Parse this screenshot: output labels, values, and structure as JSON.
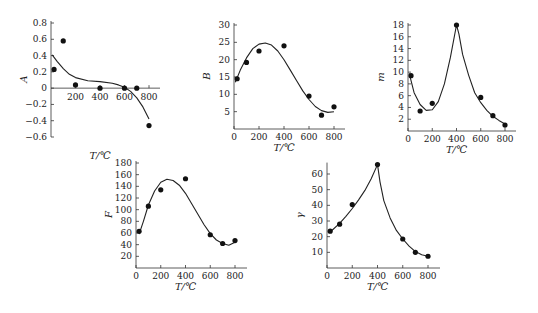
{
  "chart_data": [
    {
      "id": "A",
      "type": "scatter",
      "title": "",
      "xlabel": "T/℃",
      "ylabel": "A",
      "xlim": [
        0,
        900
      ],
      "ylim": [
        -0.6,
        0.8
      ],
      "xticks": [
        200,
        400,
        600,
        800
      ],
      "yticks": [
        -0.6,
        -0.4,
        -0.2,
        0,
        0.2,
        0.4,
        0.6,
        0.8
      ],
      "grid": false,
      "points": {
        "x": [
          25,
          100,
          200,
          400,
          600,
          700,
          800
        ],
        "y": [
          0.23,
          0.58,
          0.04,
          0.0,
          0.0,
          0.0,
          -0.46
        ]
      },
      "fit_curve": {
        "x": [
          10,
          50,
          100,
          150,
          200,
          300,
          400,
          500,
          550,
          600,
          650,
          700,
          750,
          800
        ],
        "y": [
          0.41,
          0.33,
          0.24,
          0.17,
          0.13,
          0.09,
          0.08,
          0.06,
          0.04,
          0.01,
          -0.04,
          -0.12,
          -0.23,
          -0.38
        ]
      }
    },
    {
      "id": "B",
      "type": "scatter",
      "title": "",
      "xlabel": "T/℃",
      "ylabel": "B",
      "xlim": [
        0,
        900
      ],
      "ylim": [
        0,
        30
      ],
      "xticks": [
        0,
        200,
        400,
        600,
        800
      ],
      "yticks": [
        5,
        10,
        15,
        20,
        25,
        30
      ],
      "grid": false,
      "points": {
        "x": [
          25,
          100,
          200,
          400,
          600,
          700,
          800
        ],
        "y": [
          14.5,
          19.2,
          22.5,
          24,
          9.5,
          4,
          6.4
        ]
      },
      "fit_curve": {
        "x": [
          10,
          50,
          100,
          150,
          200,
          250,
          300,
          350,
          400,
          450,
          500,
          550,
          600,
          650,
          700,
          750,
          800
        ],
        "y": [
          13.5,
          17,
          20.5,
          23.2,
          24.5,
          24.8,
          24.2,
          22.5,
          20,
          17,
          14,
          11,
          8.5,
          6.5,
          5.3,
          4.8,
          5
        ]
      }
    },
    {
      "id": "m",
      "type": "scatter",
      "title": "",
      "xlabel": "T/℃",
      "ylabel": "m",
      "xlim": [
        0,
        900
      ],
      "ylim": [
        0,
        18
      ],
      "xticks": [
        0,
        200,
        400,
        600,
        800
      ],
      "yticks": [
        2,
        4,
        6,
        8,
        10,
        12,
        14,
        16,
        18
      ],
      "grid": false,
      "points": {
        "x": [
          25,
          100,
          200,
          400,
          600,
          700,
          800
        ],
        "y": [
          9.4,
          3.4,
          4.7,
          18,
          5.7,
          2.6,
          1.0
        ]
      },
      "fit_curve": {
        "x": [
          10,
          50,
          100,
          150,
          200,
          250,
          300,
          350,
          400,
          420,
          450,
          500,
          550,
          600,
          650,
          700,
          750,
          800
        ],
        "y": [
          9.8,
          6.5,
          4.5,
          3.5,
          3.6,
          5,
          8,
          12.5,
          18,
          16.5,
          13,
          9.5,
          6.5,
          4.8,
          3.5,
          2.5,
          1.8,
          1.2
        ]
      }
    },
    {
      "id": "F",
      "type": "scatter",
      "title": "",
      "xlabel": "T/℃",
      "ylabel": "F",
      "xlim": [
        0,
        900
      ],
      "ylim": [
        0,
        180
      ],
      "xticks": [
        0,
        200,
        400,
        600,
        800
      ],
      "yticks": [
        20,
        40,
        60,
        80,
        100,
        120,
        140,
        160,
        180
      ],
      "grid": false,
      "points": {
        "x": [
          25,
          100,
          200,
          400,
          600,
          700,
          800
        ],
        "y": [
          63,
          106,
          134,
          153,
          57,
          42,
          47
        ]
      },
      "fit_curve": {
        "x": [
          25,
          60,
          100,
          150,
          200,
          250,
          300,
          350,
          400,
          450,
          500,
          550,
          600,
          650,
          700,
          750,
          800
        ],
        "y": [
          58,
          80,
          108,
          132,
          147,
          152,
          150,
          142,
          128,
          110,
          92,
          74,
          59,
          48,
          42,
          39,
          44
        ]
      }
    },
    {
      "id": "gamma",
      "type": "scatter",
      "title": "",
      "xlabel": "T/℃",
      "ylabel": "γ",
      "xlim": [
        0,
        900
      ],
      "ylim": [
        0,
        66
      ],
      "xticks": [
        0,
        200,
        400,
        600,
        800
      ],
      "yticks": [
        10,
        20,
        30,
        40,
        50,
        60
      ],
      "grid": false,
      "points": {
        "x": [
          25,
          100,
          200,
          400,
          600,
          700,
          800
        ],
        "y": [
          23.5,
          28,
          40.5,
          66,
          18.5,
          10,
          7.5
        ]
      },
      "fit_curve": {
        "x": [
          25,
          100,
          150,
          200,
          250,
          300,
          350,
          400,
          420,
          450,
          500,
          550,
          600,
          650,
          700,
          750,
          800
        ],
        "y": [
          23,
          28.5,
          33,
          38,
          43.5,
          49.5,
          57,
          66,
          55,
          43,
          32,
          24,
          18.5,
          14,
          10.5,
          8.5,
          7.5
        ]
      }
    }
  ],
  "layout": [
    {
      "x0": 51,
      "x800": 149,
      "ylo": -0.6,
      "yhi": 0.8,
      "pylo": 137,
      "pyhi": 23,
      "xaxisAtZero": true,
      "xend": 160
    },
    {
      "x0": 234,
      "x800": 334,
      "ylo": 0,
      "yhi": 30,
      "pylo": 129,
      "pyhi": 25,
      "xaxisAtZero": false,
      "xend": 345
    },
    {
      "x0": 408,
      "x800": 505,
      "ylo": 0,
      "yhi": 18,
      "pylo": 131,
      "pyhi": 25,
      "xaxisAtZero": false,
      "xend": 516
    },
    {
      "x0": 136,
      "x800": 235,
      "ylo": 0,
      "yhi": 180,
      "pylo": 268,
      "pyhi": 163,
      "xaxisAtZero": false,
      "xend": 247
    },
    {
      "x0": 327,
      "x800": 428,
      "ylo": 0,
      "yhi": 60,
      "pylo": 268,
      "pyhi": 174,
      "xaxisAtZero": false,
      "xend": 440
    }
  ]
}
